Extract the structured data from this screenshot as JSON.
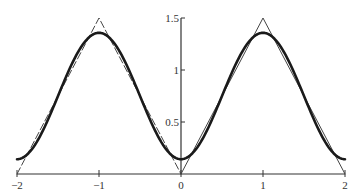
{
  "chart_data": {
    "type": "line",
    "title": "",
    "xlabel": "",
    "ylabel": "",
    "xlim": [
      -2,
      2
    ],
    "ylim": [
      0,
      1.5
    ],
    "grid": false,
    "legend": null,
    "x_ticks": [
      -2,
      -1,
      0,
      1,
      2
    ],
    "x_tick_labels": [
      "−2",
      "−1",
      "0",
      "1",
      "2"
    ],
    "y_ticks": [
      0.5,
      1,
      1.5
    ],
    "y_tick_labels": [
      "0.5",
      "1",
      "1.5"
    ],
    "series": [
      {
        "name": "triangle wave (dashed, left half)",
        "style": "dashed-thin",
        "x": [
          -2,
          -1,
          0
        ],
        "y": [
          0,
          1.5,
          0
        ]
      },
      {
        "name": "triangle wave (solid, right half)",
        "style": "solid-thin",
        "x": [
          0,
          1,
          2
        ],
        "y": [
          0,
          1.5,
          0
        ]
      },
      {
        "name": "smooth approximation",
        "style": "solid-thick",
        "formula": "0.75 - (6/pi^2) * cos(pi x)",
        "x": [
          -2,
          -1.5,
          -1,
          -0.5,
          0,
          0.5,
          1,
          1.5,
          2
        ],
        "y": [
          0.14,
          0.75,
          1.36,
          0.75,
          0.14,
          0.75,
          1.36,
          0.75,
          0.14
        ]
      }
    ]
  },
  "colors": {
    "axis": "#333333",
    "curve": "#1a1a1a",
    "triangle": "#444444"
  }
}
